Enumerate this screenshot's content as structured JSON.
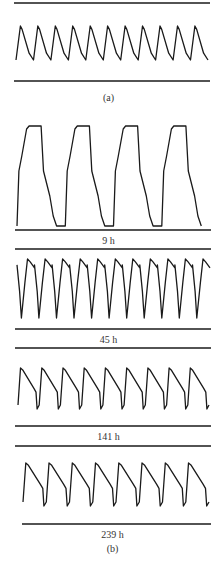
{
  "figure": {
    "panel_a": {
      "label": "(a)",
      "top_line_y": 3,
      "bottom_line_y": 81,
      "label_y": 92,
      "trace": {
        "x_start": 16,
        "x_end": 208,
        "cycles": 11,
        "peak_y": 26,
        "trough_y": 60,
        "shape": "sawtooth-sharp"
      }
    },
    "panel_b": {
      "label": "(b)",
      "label_y": 543,
      "recordings": [
        {
          "time_label": "9 h",
          "top_line_y": null,
          "bottom_line_y": 230,
          "label_y": 235,
          "trace": {
            "x_start": 17,
            "x_end": 210,
            "cycles": 4,
            "peak_y": 126,
            "trough_y": 226,
            "shape": "plateau"
          }
        },
        {
          "time_label": "45 h",
          "top_line_y": 249,
          "bottom_line_y": 329,
          "label_y": 334,
          "trace": {
            "x_start": 17,
            "x_end": 210,
            "cycles": 11,
            "peak_y": 259,
            "trough_y": 318,
            "shape": "spike-down"
          }
        },
        {
          "time_label": "141 h",
          "top_line_y": 348,
          "bottom_line_y": 426,
          "label_y": 431,
          "trace": {
            "x_start": 18,
            "x_end": 209,
            "cycles": 9,
            "peak_y": 368,
            "trough_y": 405,
            "shape": "decay"
          }
        },
        {
          "time_label": "239 h",
          "top_line_y": 446,
          "bottom_line_y": 524,
          "label_y": 529,
          "trace": {
            "x_start": 23,
            "x_end": 209,
            "cycles": 8,
            "peak_y": 463,
            "trough_y": 502,
            "shape": "decay"
          }
        }
      ]
    },
    "colors": {
      "ink": "#1a1a1a",
      "background": "#ffffff"
    }
  }
}
